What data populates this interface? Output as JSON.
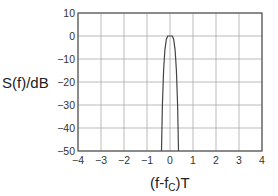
{
  "chart_data": {
    "type": "line",
    "title": "",
    "xlabel": "(f-f_C)T",
    "xlabel_main": "(f-f",
    "xlabel_sub": "C",
    "xlabel_tail": ")T",
    "ylabel": "S(f)/dB",
    "xlim": [
      -4,
      4
    ],
    "ylim": [
      -50,
      10
    ],
    "xticks": [
      -4,
      -3,
      -2,
      -1,
      0,
      1,
      2,
      3,
      4
    ],
    "xtick_labels": [
      "−4",
      "−3",
      "−2",
      "−1",
      "0",
      "1",
      "2",
      "3",
      "4"
    ],
    "yticks": [
      10,
      0,
      -10,
      -20,
      -30,
      -40,
      -50
    ],
    "ytick_labels": [
      "10",
      "0",
      "−10",
      "−20",
      "−30",
      "−40",
      "−50"
    ],
    "grid": true,
    "legend": null,
    "series": [
      {
        "name": "S(f)",
        "color": "#444444",
        "x": [
          -0.37,
          -0.33,
          -0.28,
          -0.22,
          -0.16,
          -0.1,
          0.1,
          0.16,
          0.22,
          0.28,
          0.33,
          0.37
        ],
        "y": [
          -50,
          -30,
          -15,
          -6,
          -1.5,
          0,
          0,
          -1.5,
          -6,
          -15,
          -30,
          -50
        ]
      }
    ]
  },
  "colors": {
    "axis": "#555555",
    "grid": "#aaaaaa",
    "curve": "#444444"
  }
}
